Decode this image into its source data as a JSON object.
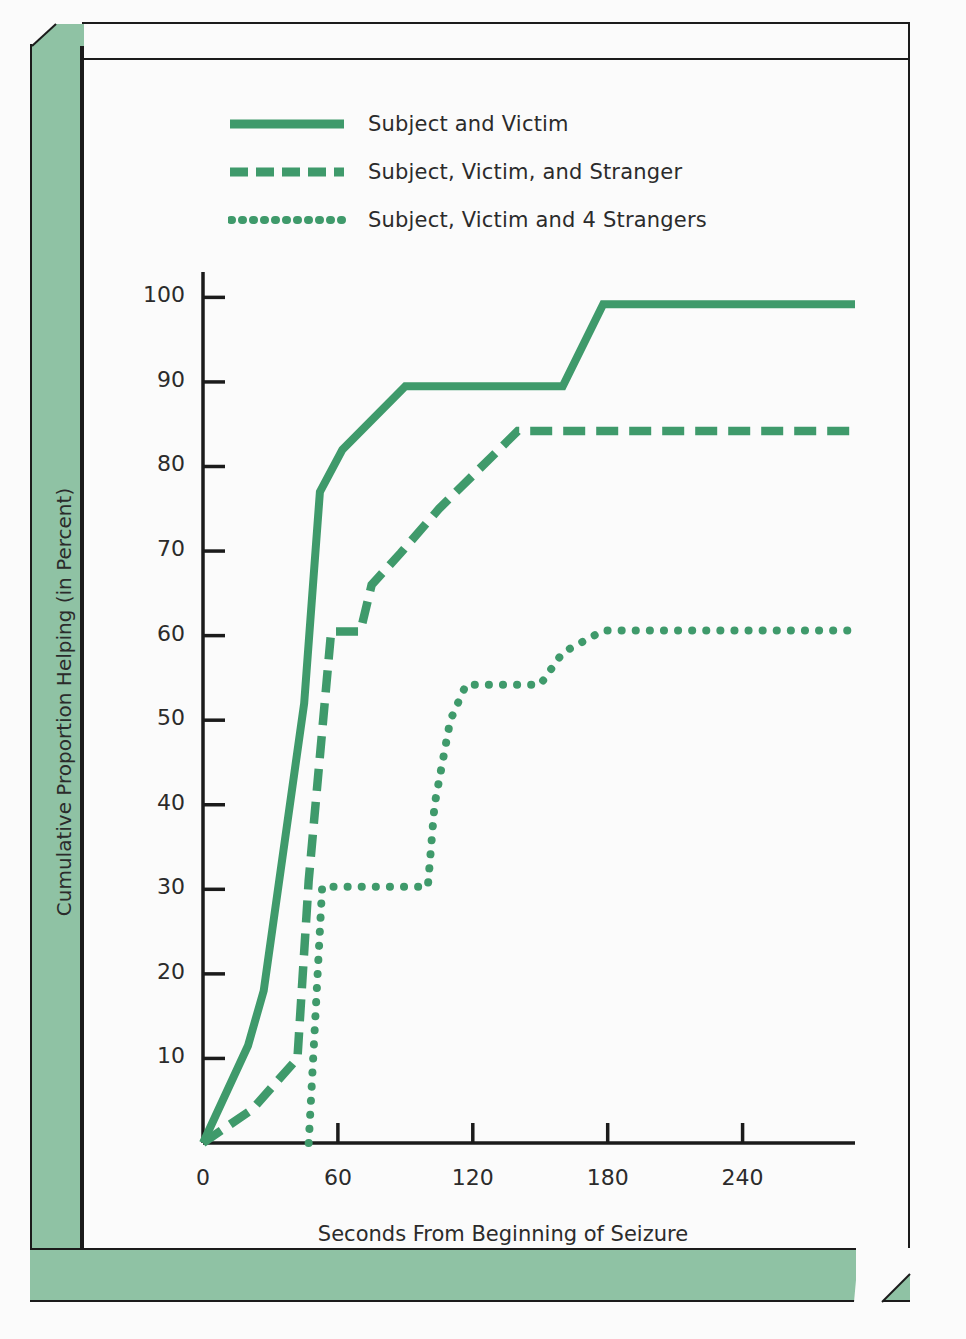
{
  "chart_data": {
    "type": "line",
    "title": "",
    "xlabel": "Seconds From Beginning of Seizure",
    "ylabel": "Cumulative Proportion Helping (in Percent)",
    "xlim": [
      0,
      290
    ],
    "ylim": [
      0,
      103
    ],
    "xticks": [
      0,
      60,
      120,
      180,
      240
    ],
    "yticks": [
      10,
      20,
      30,
      40,
      50,
      60,
      70,
      80,
      90,
      100
    ],
    "grid": false,
    "legend_position": "top-center",
    "series": [
      {
        "name": "Subject and Victim",
        "style": "solid",
        "color": "#3f9a6b",
        "points": [
          [
            0,
            0
          ],
          [
            20,
            11.5
          ],
          [
            27,
            18
          ],
          [
            45,
            52
          ],
          [
            52,
            77
          ],
          [
            62,
            82
          ],
          [
            90,
            89.5
          ],
          [
            160,
            89.5
          ],
          [
            178,
            99.2
          ],
          [
            290,
            99.2
          ]
        ]
      },
      {
        "name": "Subject, Victim, and Stranger",
        "style": "dashed",
        "color": "#3f9a6b",
        "points": [
          [
            0,
            0
          ],
          [
            22,
            4
          ],
          [
            42,
            10
          ],
          [
            47,
            31
          ],
          [
            57,
            60.5
          ],
          [
            70,
            60.5
          ],
          [
            75,
            66
          ],
          [
            88,
            69.8
          ],
          [
            105,
            75
          ],
          [
            140,
            84.2
          ],
          [
            290,
            84.2
          ]
        ]
      },
      {
        "name": "Subject, Victim and 4 Strangers",
        "style": "dotted",
        "color": "#3f9a6b",
        "points": [
          [
            47,
            0
          ],
          [
            50,
            15
          ],
          [
            53,
            30.3
          ],
          [
            100,
            30.3
          ],
          [
            103,
            40
          ],
          [
            110,
            50
          ],
          [
            117,
            54.2
          ],
          [
            150,
            54.2
          ],
          [
            160,
            58
          ],
          [
            178,
            60.6
          ],
          [
            290,
            60.6
          ]
        ]
      }
    ]
  },
  "legend": {
    "items": [
      {
        "label": "Subject and Victim",
        "style": "solid"
      },
      {
        "label": "Subject, Victim, and Stranger",
        "style": "dashed"
      },
      {
        "label": "Subject, Victim and 4 Strangers",
        "style": "dotted"
      }
    ]
  },
  "colors": {
    "line_green": "#3f9a6b",
    "bevel_green": "#8fc2a4",
    "axis_black": "#1b1b1b",
    "page_background": "#fbfbfb"
  }
}
